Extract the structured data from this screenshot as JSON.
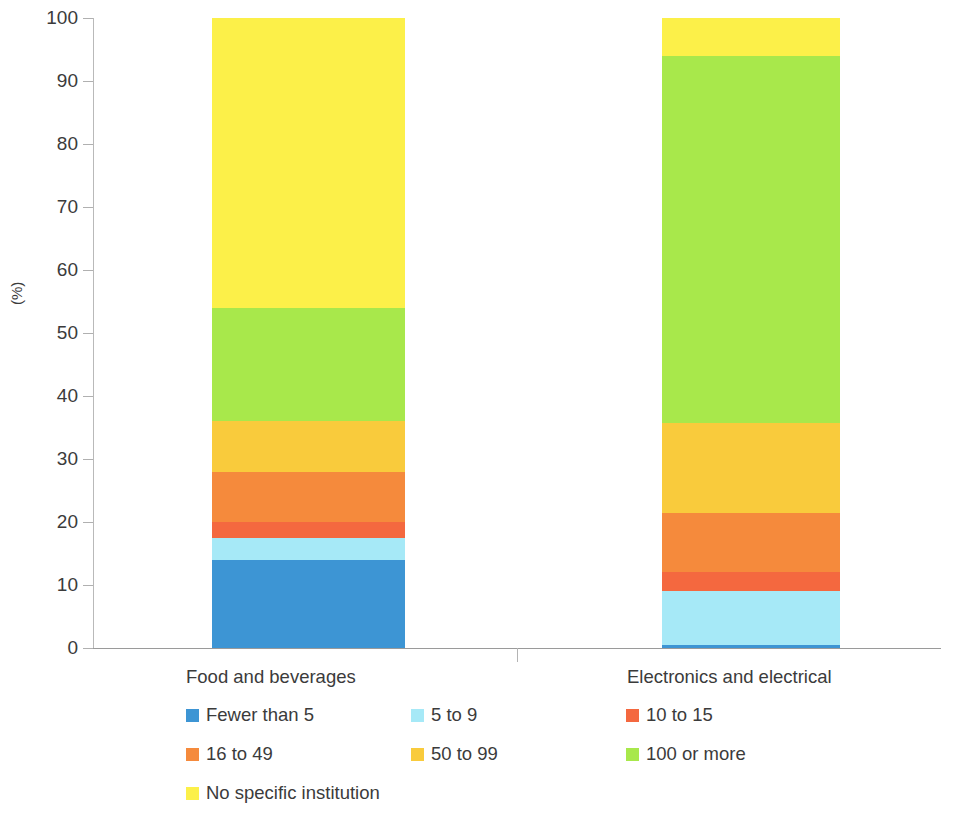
{
  "chart_data": {
    "type": "bar",
    "subtype": "stacked-bar-100",
    "title": "",
    "subtitle": "",
    "xlabel": "",
    "ylabel": "(%)",
    "ylim": [
      0,
      100
    ],
    "yticks": [
      0,
      10,
      20,
      30,
      40,
      50,
      60,
      70,
      80,
      90,
      100
    ],
    "ytick_labels": [
      "0",
      "10",
      "20",
      "30",
      "40",
      "50",
      "60",
      "70",
      "80",
      "90",
      "100"
    ],
    "grid": false,
    "legend_position": "bottom",
    "categories": [
      "Food and beverages",
      "Electronics and electrical"
    ],
    "series": [
      {
        "name": "Fewer than 5",
        "color": "#3d95d4",
        "values": [
          14.0,
          0.5
        ]
      },
      {
        "name": "5 to 9",
        "color": "#a6e9f7",
        "values": [
          3.5,
          8.5
        ]
      },
      {
        "name": "10 to 15",
        "color": "#f4683f",
        "values": [
          2.5,
          3.0
        ]
      },
      {
        "name": "16 to 49",
        "color": "#f58a3c",
        "values": [
          8.0,
          9.5
        ]
      },
      {
        "name": "50 to 99",
        "color": "#f9cb3c",
        "values": [
          8.0,
          14.2
        ]
      },
      {
        "name": "100 or more",
        "color": "#a8e84b",
        "values": [
          18.0,
          58.3
        ]
      },
      {
        "name": "No specific institution",
        "color": "#fcf049",
        "values": [
          46.0,
          6.0
        ]
      }
    ]
  },
  "axis": {
    "y_title": "(%)",
    "ticks": [
      "100",
      "90",
      "80",
      "70",
      "60",
      "50",
      "40",
      "30",
      "20",
      "10",
      "0"
    ]
  },
  "categories": {
    "cat_1": "Food and beverages",
    "cat_2": "Electronics and electrical"
  },
  "legend": {
    "items": [
      {
        "label": "Fewer than 5",
        "color": "#3d95d4"
      },
      {
        "label": "5 to 9",
        "color": "#a6e9f7"
      },
      {
        "label": "10 to 15",
        "color": "#f4683f"
      },
      {
        "label": "16 to 49",
        "color": "#f58a3c"
      },
      {
        "label": "50 to 99",
        "color": "#f9cb3c"
      },
      {
        "label": "100 or more",
        "color": "#a8e84b"
      },
      {
        "label": "No specific institution",
        "color": "#fcf049"
      }
    ]
  }
}
